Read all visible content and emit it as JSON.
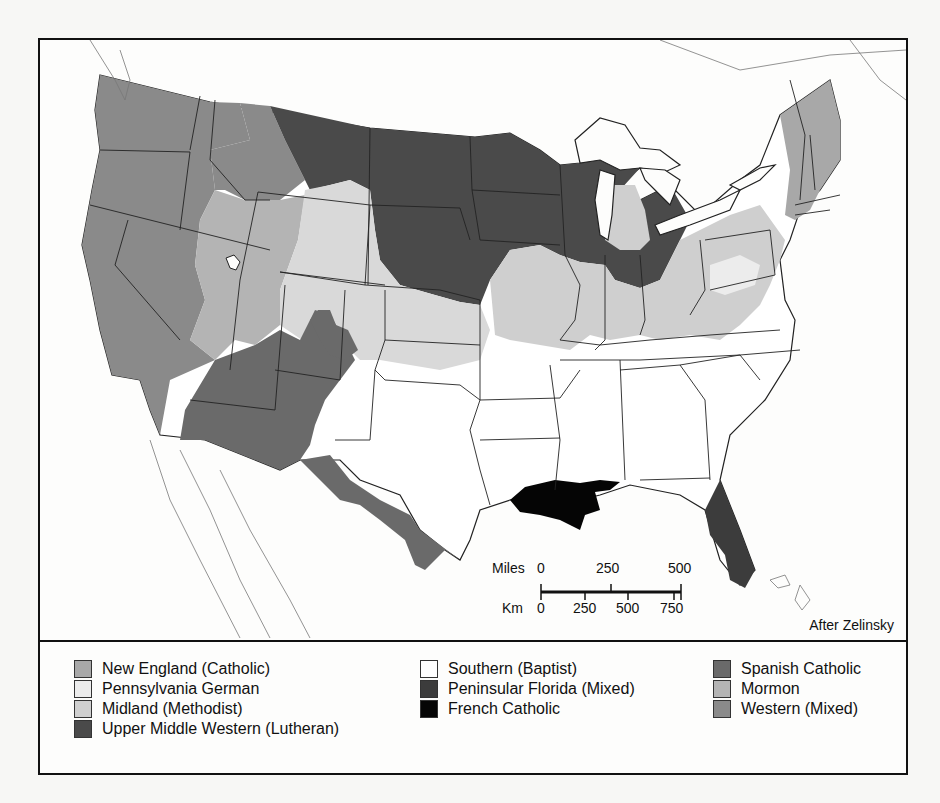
{
  "map": {
    "title": "Religious Regions of the United States",
    "credit": "After Zelinsky",
    "colors": {
      "new_england": "#a8a8a8",
      "pennsylvania_german": "#ececec",
      "midland": "#cfcfcf",
      "upper_middle_western": "#4a4a4a",
      "southern": "#ffffff",
      "peninsular_florida": "#3c3c3c",
      "french_catholic": "#050505",
      "spanish_catholic": "#6a6a6a",
      "mormon": "#b4b4b4",
      "western": "#8a8a8a",
      "water": "#fdfdfc",
      "border": "#222222"
    }
  },
  "scale_bar": {
    "miles_label": "Miles",
    "miles_ticks": [
      "0",
      "250",
      "500"
    ],
    "km_label": "Km",
    "km_ticks": [
      "0",
      "250",
      "500",
      "750"
    ]
  },
  "legend": {
    "columns": [
      [
        {
          "label": "New England (Catholic)",
          "color": "#a8a8a8"
        },
        {
          "label": "Pennsylvania German",
          "color": "#ececec"
        },
        {
          "label": "Midland (Methodist)",
          "color": "#cfcfcf"
        },
        {
          "label": "Upper Middle Western (Lutheran)",
          "color": "#4a4a4a"
        }
      ],
      [
        {
          "label": "Southern (Baptist)",
          "color": "#ffffff"
        },
        {
          "label": "Peninsular Florida (Mixed)",
          "color": "#3c3c3c"
        },
        {
          "label": "French Catholic",
          "color": "#050505"
        }
      ],
      [
        {
          "label": "Spanish Catholic",
          "color": "#6a6a6a"
        },
        {
          "label": "Mormon",
          "color": "#b4b4b4"
        },
        {
          "label": "Western (Mixed)",
          "color": "#8a8a8a"
        }
      ]
    ]
  }
}
